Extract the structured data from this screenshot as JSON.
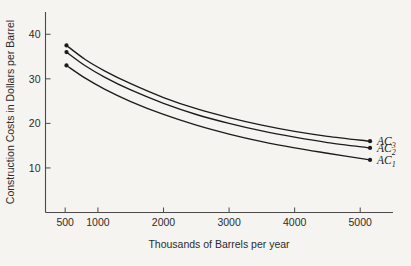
{
  "chart_data": {
    "type": "line",
    "title": "",
    "xlabel": "Thousands of Barrels per year",
    "ylabel": "Construction Costs in Dollars per Barrel",
    "xlim": [
      200,
      5500
    ],
    "ylim": [
      0,
      45
    ],
    "grid": false,
    "legend_position": "right-inline-labels",
    "xticks": [
      500,
      1000,
      2000,
      3000,
      4000,
      5000
    ],
    "xtick_labels": [
      "500",
      "1000",
      "2000",
      "3000",
      "4000",
      "5000"
    ],
    "yticks": [
      10,
      20,
      30,
      40
    ],
    "ytick_labels": [
      "10",
      "20",
      "30",
      "40"
    ],
    "series": [
      {
        "name": "AC_3",
        "label_base": "AC",
        "label_sub": "3",
        "x": [
          520,
          800,
          1100,
          1500,
          2000,
          2500,
          3000,
          3500,
          4000,
          4500,
          5150
        ],
        "values": [
          37.5,
          34.4,
          31.8,
          28.9,
          25.8,
          23.3,
          21.3,
          19.6,
          18.2,
          17.1,
          16.0
        ]
      },
      {
        "name": "AC_2",
        "label_base": "AC",
        "label_sub": "2",
        "x": [
          520,
          800,
          1100,
          1500,
          2000,
          2500,
          3000,
          3500,
          4000,
          4500,
          5150
        ],
        "values": [
          36.0,
          33.0,
          30.4,
          27.5,
          24.5,
          22.0,
          20.0,
          18.3,
          16.9,
          15.7,
          14.5
        ]
      },
      {
        "name": "AC_1",
        "label_base": "AC",
        "label_sub": "1",
        "x": [
          520,
          800,
          1100,
          1500,
          2000,
          2500,
          3000,
          3500,
          4000,
          4500,
          5150
        ],
        "values": [
          33.0,
          30.2,
          27.7,
          24.9,
          22.0,
          19.6,
          17.6,
          15.9,
          14.5,
          13.3,
          11.8
        ]
      }
    ],
    "endpoint_markers": {
      "left": [
        {
          "series": "AC_3",
          "x": 520,
          "y": 37.5
        },
        {
          "series": "AC_2",
          "x": 520,
          "y": 36.0
        },
        {
          "series": "AC_1",
          "x": 520,
          "y": 33.0
        }
      ],
      "right": [
        {
          "series": "AC_3",
          "x": 5150,
          "y": 16.0
        },
        {
          "series": "AC_2",
          "x": 5150,
          "y": 14.5
        },
        {
          "series": "AC_1",
          "x": 5150,
          "y": 11.8
        }
      ]
    },
    "colors": {
      "background": "#f6f4f0",
      "curve": "#1c1c1c",
      "axis": "#4a4a48",
      "text": "#2b2b2b"
    }
  }
}
